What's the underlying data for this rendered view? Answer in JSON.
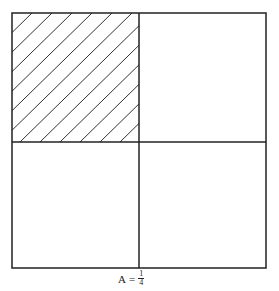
{
  "diagram": {
    "grid": {
      "rows": 2,
      "cols": 2
    },
    "shaded_cell": {
      "row": 0,
      "col": 0,
      "pattern": "diagonal-hatch"
    },
    "colors": {
      "stroke": "#222222",
      "background": "#ffffff"
    }
  },
  "caption": {
    "variable": "A",
    "equals": "=",
    "numerator": "1",
    "denominator": "4"
  }
}
